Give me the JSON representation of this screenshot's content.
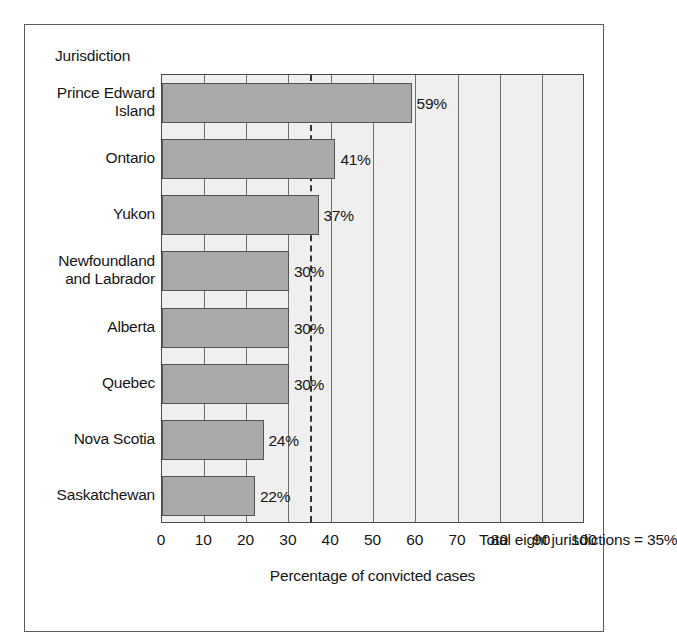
{
  "figure": {
    "y_axis_title": "Jurisdiction",
    "x_axis_title": "Percentage of convicted cases",
    "annotation": "Total eight jurisdictions = 35%",
    "bar_color": "#a9a9a9",
    "plot_background": "#efefef",
    "border_color": "#4a4a4a",
    "target_line_color": "#333333"
  },
  "chart_data": {
    "type": "bar",
    "orientation": "horizontal",
    "title": "",
    "subtitle": "",
    "xlabel": "Percentage of convicted cases",
    "ylabel": "Jurisdiction",
    "xlim": [
      0,
      100
    ],
    "grid": true,
    "legend": false,
    "categories": [
      "Prince Edward Island",
      "Ontario",
      "Yukon",
      "Newfoundland and Labrador",
      "Alberta",
      "Quebec",
      "Nova Scotia",
      "Saskatchewan"
    ],
    "category_display": [
      "Prince Edward\nIsland",
      "Ontario",
      "Yukon",
      "Newfoundland\nand Labrador",
      "Alberta",
      "Quebec",
      "Nova Scotia",
      "Saskatchewan"
    ],
    "values": [
      59,
      41,
      37,
      30,
      30,
      30,
      24,
      22
    ],
    "data_labels": [
      "59%",
      "41%",
      "37%",
      "30%",
      "30%",
      "30%",
      "24%",
      "22%"
    ],
    "xticks": [
      0,
      10,
      20,
      30,
      40,
      50,
      60,
      70,
      80,
      90,
      100
    ],
    "xtick_labels": [
      "0",
      "10",
      "20",
      "30",
      "40",
      "50",
      "60",
      "70",
      "80",
      "90",
      "100"
    ],
    "reference_line": {
      "value": 35,
      "label": "Total eight jurisdictions = 35%",
      "style": "dashed"
    }
  }
}
